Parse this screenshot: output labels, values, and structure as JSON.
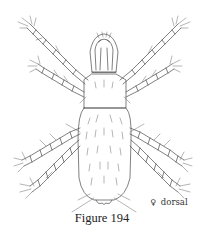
{
  "figure": {
    "caption": "Figure 194",
    "view_label": {
      "sex_symbol": "♀",
      "view": "dorsal"
    },
    "colors": {
      "ink": "#4a4a4a",
      "background": "#ffffff",
      "text": "#222222"
    }
  }
}
